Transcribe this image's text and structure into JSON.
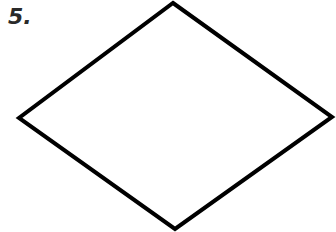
{
  "problem": {
    "number_label": "5.",
    "shape": "rhombus",
    "vertices": {
      "top": [
        173,
        3
      ],
      "right": [
        332,
        117
      ],
      "bottom": [
        175,
        229
      ],
      "left": [
        19,
        118
      ]
    },
    "stroke_color": "#000000",
    "stroke_width": 4
  }
}
